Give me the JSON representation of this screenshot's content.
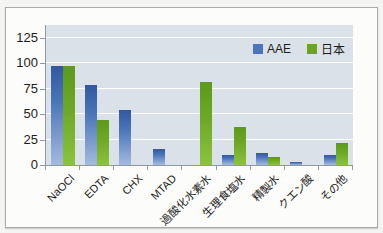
{
  "chart_data": {
    "type": "bar",
    "title": "",
    "xlabel": "",
    "ylabel": "",
    "categories": [
      "NaOCl",
      "EDTA",
      "CHX",
      "MTAD",
      "過酸化水素水",
      "生理食塩水",
      "精製水",
      "クエン酸",
      "その他"
    ],
    "series": [
      {
        "name": "AAE",
        "color": "#4a77bb",
        "values": [
          97,
          79,
          54,
          16,
          0,
          10,
          12,
          3,
          10
        ]
      },
      {
        "name": "日本",
        "color": "#6ba32a",
        "values": [
          97,
          44,
          0,
          0,
          82,
          37,
          8,
          0,
          22
        ]
      }
    ],
    "yticks": [
      0,
      25,
      50,
      75,
      100,
      125
    ],
    "ylim": [
      0,
      125
    ],
    "grid": true,
    "legend_position": "top-right",
    "colors": {
      "plot_background": "#dae1e8",
      "gridline": "#ffffff",
      "axis": "#8e99a2",
      "bar_blue_top": "#33589f",
      "bar_blue_bottom": "#a3bbdf",
      "bar_green_top": "#5d9a1b",
      "bar_green_bottom": "#8bc33d"
    }
  }
}
